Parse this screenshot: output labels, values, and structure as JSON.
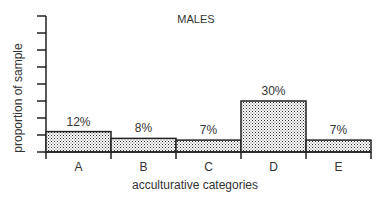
{
  "chart_data": {
    "type": "bar",
    "title": "MALES",
    "xlabel": "acculturative categories",
    "ylabel": "proportion of sample",
    "categories": [
      "A",
      "B",
      "C",
      "D",
      "E"
    ],
    "values": [
      12,
      8,
      7,
      30,
      7
    ],
    "value_labels": [
      "12%",
      "8%",
      "7%",
      "30%",
      "7%"
    ],
    "ylim": [
      0,
      80
    ],
    "y_ticks_count": 9,
    "y_tick_labels_shown": false,
    "grid": false,
    "legend": null,
    "bar_fill": "stippled",
    "colors": {
      "ink": "#222222",
      "fill_dots": "#333333",
      "background": "#ffffff"
    }
  }
}
